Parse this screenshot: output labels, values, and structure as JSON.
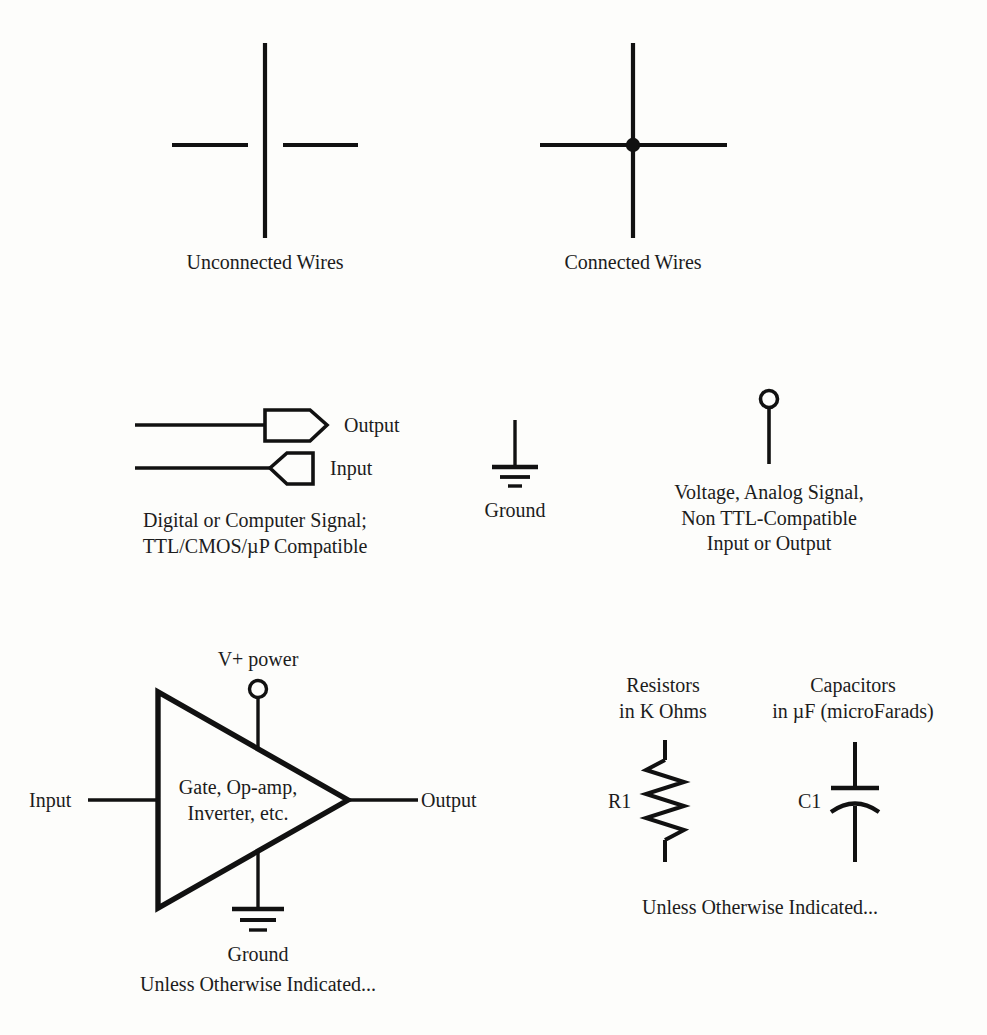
{
  "page": {
    "background_color": "#fdfdfb",
    "ink_color": "#111111"
  },
  "sections": {
    "wires": {
      "unconnected": {
        "caption": "Unconnected Wires",
        "description": "vertical wire crossing two horizontal wire stubs with a gap, no junction dot"
      },
      "connected": {
        "caption": "Connected Wires",
        "description": "vertical wire crossing a horizontal wire with a solid junction dot"
      }
    },
    "digital_signal": {
      "output_label": "Output",
      "input_label": "Input",
      "caption_line1": "Digital or Computer Signal;",
      "caption_line2": "TTL/CMOS/µP Compatible"
    },
    "ground_symbol": {
      "caption": "Ground"
    },
    "analog_signal": {
      "caption_line1": "Voltage, Analog Signal,",
      "caption_line2": "Non TTL-Compatible",
      "caption_line3": "Input or Output"
    },
    "amplifier": {
      "power_label": "V+ power",
      "input_label": "Input",
      "output_label": "Output",
      "body_line1": "Gate, Op-amp,",
      "body_line2": "Inverter, etc.",
      "ground_label": "Ground",
      "note": "Unless Otherwise Indicated..."
    },
    "passives": {
      "resistor": {
        "heading_line1": "Resistors",
        "heading_line2": "in K Ohms",
        "designator": "R1"
      },
      "capacitor": {
        "heading_line1": "Capacitors",
        "heading_line2": "in µF (microFarads)",
        "designator": "C1"
      },
      "note": "Unless Otherwise Indicated..."
    }
  }
}
